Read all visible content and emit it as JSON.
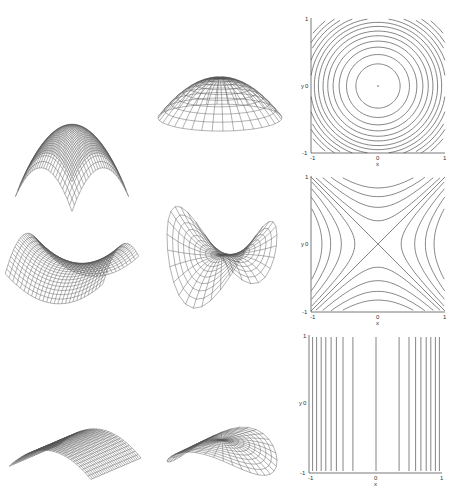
{
  "figure": {
    "rows": [
      {
        "name": "elliptic-paraboloid",
        "surface_cartesian": "cap (z = -(x^2+y^2)), square grid",
        "surface_polar": "cap on polar grid",
        "contour": "concentric circles"
      },
      {
        "name": "hyperbolic-paraboloid",
        "surface_cartesian": "saddle (z = x^2 - y^2), square grid",
        "surface_polar": "saddle on polar grid",
        "contour": "hyperbolas with crossing asymptotes"
      },
      {
        "name": "parabolic-cylinder",
        "surface_cartesian": "ridge (z = -x^2), square grid",
        "surface_polar": "ridge on polar grid",
        "contour": "vertical lines"
      }
    ],
    "contour_axes": {
      "x_label": "x",
      "y_label": "y",
      "x_ticks": [
        "-1",
        "0",
        "1"
      ],
      "y_ticks": [
        "-1",
        "0",
        "1"
      ]
    },
    "colors": {
      "line": "#555555",
      "background": "#ffffff"
    }
  },
  "labels": {
    "p1": {
      "xl": "x",
      "yl": "y",
      "xm": "-1",
      "x0": "0",
      "xp": "1",
      "ym": "-1",
      "y0": "0",
      "yp": "1"
    },
    "p2": {
      "xl": "x",
      "yl": "y",
      "xm": "-1",
      "x0": "0",
      "xp": "1",
      "ym": "-1",
      "y0": "0",
      "yp": "1"
    },
    "p3": {
      "xl": "x",
      "yl": "y",
      "xm": "-1",
      "x0": "0",
      "xp": "1",
      "ym": "-1",
      "y0": "0",
      "yp": "1"
    }
  }
}
